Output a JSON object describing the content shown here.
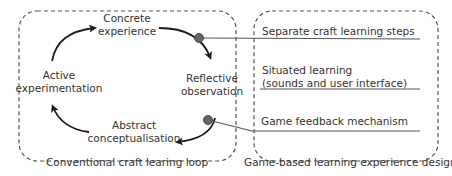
{
  "left_panel": {
    "caption": "Conventional craft learing loop",
    "stages": [
      {
        "line1": "Concrete",
        "line2": "experience"
      },
      {
        "line1": "Reflective",
        "line2": "observation"
      },
      {
        "line1": "Abstract",
        "line2": "conceptualisation"
      },
      {
        "line1": "Active",
        "line2": "experimentation"
      }
    ]
  },
  "right_panel": {
    "caption": "Game-based learning experience design",
    "items": [
      {
        "line1": "Separate craft learning steps"
      },
      {
        "line1": "Situated learning",
        "line2": "(sounds and user interface)"
      },
      {
        "line1": "Game feedback mechanism"
      }
    ]
  },
  "colors": {
    "stroke": "#2a2a2a",
    "dash": "#555555",
    "node": "#666666",
    "connector": "#555555",
    "text": "#333333"
  }
}
